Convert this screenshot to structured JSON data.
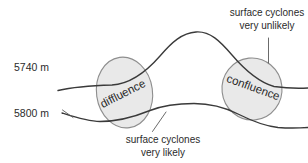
{
  "diagram": {
    "background_color": "#ffffff",
    "line_color": "#3a3a3a",
    "ellipse_fill": "#e9e9e9",
    "ellipse_stroke": "#8e8e8e",
    "text_color": "#2b2b2b"
  },
  "contours": [
    {
      "label": "5740 m",
      "name": "upper-contour"
    },
    {
      "label": "5800 m",
      "name": "lower-contour"
    }
  ],
  "zones": [
    {
      "label": "diffluence",
      "rotation_deg": -27
    },
    {
      "label": "confluence",
      "rotation_deg": 20
    }
  ],
  "annotations": {
    "upper": {
      "line1": "surface cyclones",
      "line2": "very unlikely"
    },
    "lower": {
      "line1": "surface cyclones",
      "line2": "very likely"
    }
  }
}
